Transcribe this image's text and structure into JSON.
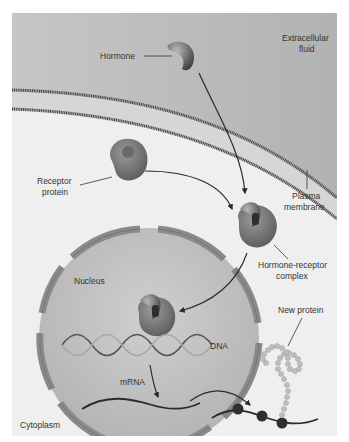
{
  "labels": {
    "extracellular_line1": "Extracellular",
    "extracellular_line2": "fluid",
    "hormone": "Hormone",
    "receptor_line1": "Receptor",
    "receptor_line2": "protein",
    "plasma_line1": "Plasma",
    "plasma_line2": "membrane",
    "complex_line1": "Hormone-receptor",
    "complex_line2": "complex",
    "nucleus": "Nucleus",
    "dna": "DNA",
    "mrna": "mRNA",
    "new_protein": "New protein",
    "cytoplasm": "Cytoplasm"
  },
  "colors": {
    "extracellular": "#bdbdbd",
    "membrane_band": "#d8d8d8",
    "membrane_line": "#4a4a4a",
    "cytoplasm": "#efefef",
    "nucleus": "#c4c4c4",
    "envelope": "#8a8a8a",
    "protein": "#7a7a7a",
    "arrow": "#2a2a2a",
    "bead": "#bdbdbd",
    "ribosome": "#2f2f2f"
  }
}
